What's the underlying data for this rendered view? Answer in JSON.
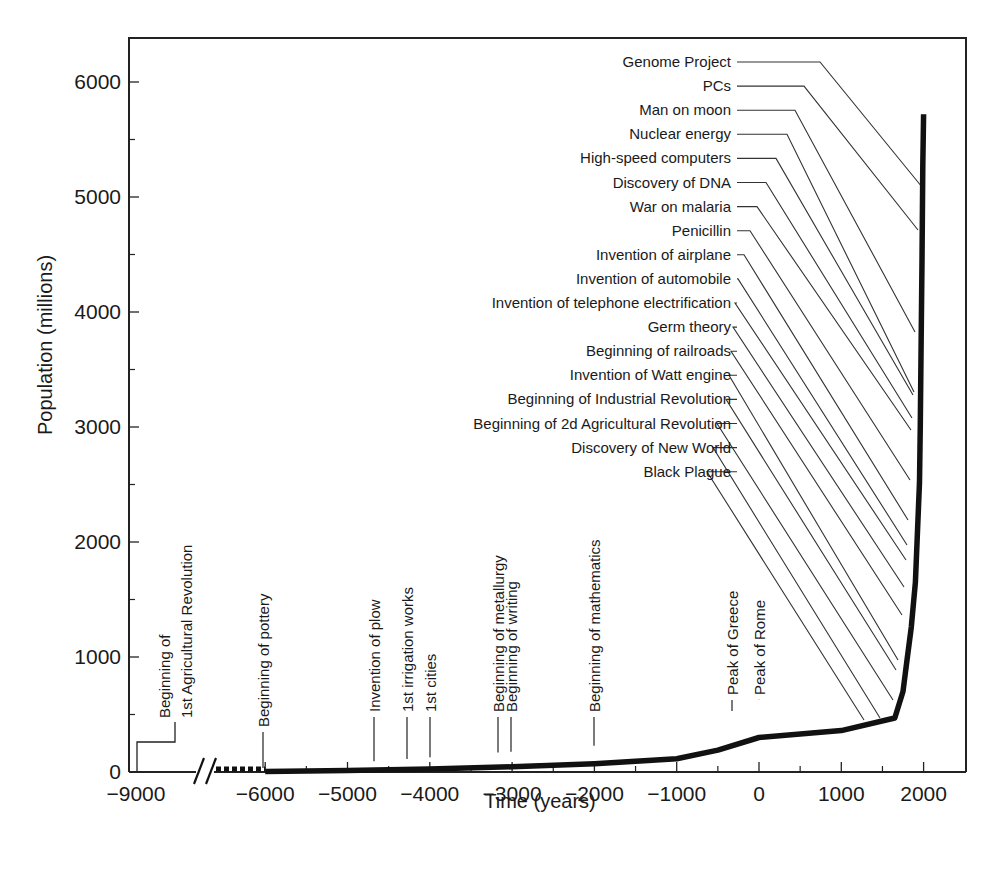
{
  "chart_data": {
    "type": "line",
    "title": "",
    "xlabel": "Time (years)",
    "ylabel": "Population (millions)",
    "xlim": [
      -9000,
      2500
    ],
    "ylim": [
      0,
      6400
    ],
    "x_ticks": [
      -9000,
      -6000,
      -5000,
      -4000,
      -3000,
      -2000,
      -1000,
      0,
      1000,
      2000
    ],
    "x_tick_labels": [
      "−9000",
      "−6000",
      "−5000",
      "−4000",
      "−3000",
      "−2000",
      "−1000",
      "0",
      "1000",
      "2000"
    ],
    "y_ticks": [
      0,
      1000,
      2000,
      3000,
      4000,
      5000,
      6000
    ],
    "y_tick_labels": [
      "0",
      "1000",
      "2000",
      "3000",
      "4000",
      "5000",
      "6000"
    ],
    "grid": false,
    "legend": null,
    "axis_break": {
      "between": [
        -9000,
        -6000
      ],
      "note": "broken axis with dashed curve segment"
    },
    "series": [
      {
        "name": "World population",
        "x": [
          -6000,
          -5000,
          -4000,
          -3000,
          -2000,
          -1000,
          -500,
          0,
          1000,
          1650,
          1750,
          1800,
          1850,
          1900,
          1950,
          1960,
          1970,
          1980,
          1990,
          2000
        ],
        "y": [
          5,
          14,
          27,
          45,
          72,
          115,
          190,
          300,
          360,
          470,
          700,
          980,
          1260,
          1650,
          2520,
          3020,
          3700,
          4440,
          5270,
          5720
        ]
      }
    ],
    "early_marker": {
      "label_lines": [
        "Beginning of",
        "1st Agricultural Revolution"
      ],
      "x": -8800,
      "y": 260
    },
    "annotations_bottom": [
      {
        "label": "Beginning of pottery",
        "x": -6000
      },
      {
        "label": "Invention of plow",
        "x": -4650
      },
      {
        "label": "1st irrigation works",
        "x": -4250
      },
      {
        "label": "1st cities",
        "x": -3950
      },
      {
        "label": "Beginning of metallurgy",
        "x": -3200
      },
      {
        "label": "Beginning of writing",
        "x": -3050
      },
      {
        "label": "Beginning of mathematics",
        "x": -2000
      },
      {
        "label": "Peak of Greece",
        "x": -350
      },
      {
        "label": "Peak of Rome",
        "x": 0
      }
    ],
    "annotations_right": [
      {
        "label": "Genome Project",
        "x": 1990,
        "y": 5350
      },
      {
        "label": "PCs",
        "x": 1980,
        "y": 4730
      },
      {
        "label": "Man on moon",
        "x": 1969,
        "y": 3820
      },
      {
        "label": "Nuclear energy",
        "x": 1945,
        "y": 3620
      },
      {
        "label": "High-speed computers",
        "x": 1946,
        "y": 3250
      },
      {
        "label": "Discovery of DNA",
        "x": 1953,
        "y": 2970
      },
      {
        "label": "War on malaria",
        "x": 1945,
        "y": 2850
      },
      {
        "label": "Penicillin",
        "x": 1928,
        "y": 2400
      },
      {
        "label": "Invention of airplane",
        "x": 1903,
        "y": 2050
      },
      {
        "label": "Invention of automobile",
        "x": 1885,
        "y": 1800
      },
      {
        "label": "Invention of telephone electrification",
        "x": 1876,
        "y": 1620
      },
      {
        "label": "Germ theory",
        "x": 1860,
        "y": 1400
      },
      {
        "label": "Beginning of railroads",
        "x": 1825,
        "y": 1190
      },
      {
        "label": "Invention of Watt engine",
        "x": 1769,
        "y": 900
      },
      {
        "label": "Beginning of Industrial Revolution",
        "x": 1750,
        "y": 720
      },
      {
        "label": "Beginning of 2d Agricultural Revolution",
        "x": 1700,
        "y": 600
      },
      {
        "label": "Discovery of New World",
        "x": 1492,
        "y": 460
      },
      {
        "label": "Black Plague",
        "x": 1350,
        "y": 440
      }
    ]
  }
}
